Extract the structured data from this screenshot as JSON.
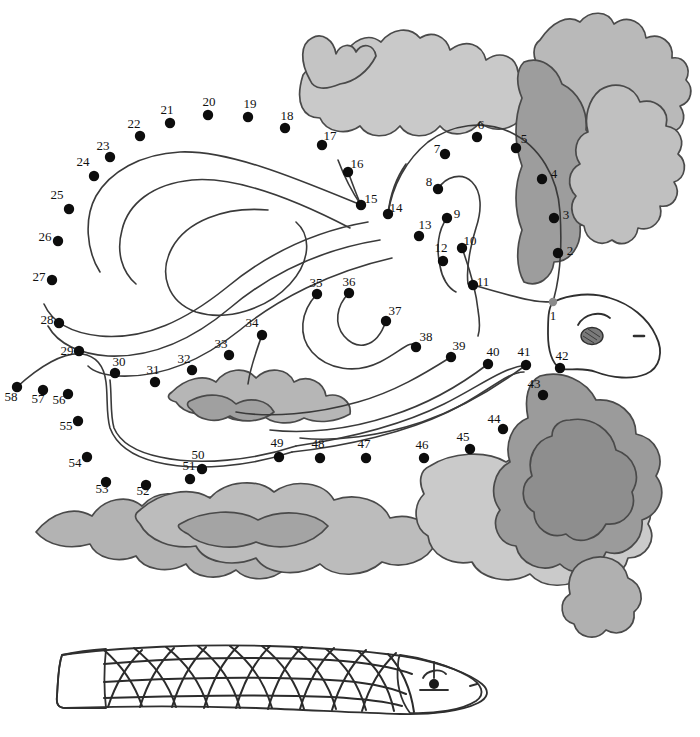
{
  "page": {
    "background_color": "#ffffff",
    "width": 700,
    "height": 737
  },
  "colors": {
    "dot": "#0d0d0d",
    "start_dot": "#8a8a8a",
    "label": "#111111",
    "guide_line": "#3a3a3a",
    "kelp_light": "#cfcfcf",
    "kelp_mid": "#b4b4b4",
    "kelp_dark": "#9a9a9a",
    "fish_body": "#d2d2d2",
    "fish_tail": "#c2c2c2",
    "outline": "#3c3c3c"
  },
  "puzzle": {
    "name": "sea-dragon-dot-to-dot",
    "dot_count": 58,
    "dots": [
      {
        "n": "1",
        "x": 553,
        "y": 302,
        "lx": 553,
        "ly": 320,
        "start": true
      },
      {
        "n": "2",
        "x": 558,
        "y": 253,
        "lx": 570,
        "ly": 255
      },
      {
        "n": "3",
        "x": 554,
        "y": 218,
        "lx": 566,
        "ly": 219
      },
      {
        "n": "4",
        "x": 542,
        "y": 179,
        "lx": 554,
        "ly": 178
      },
      {
        "n": "5",
        "x": 516,
        "y": 148,
        "lx": 524,
        "ly": 143
      },
      {
        "n": "6",
        "x": 477,
        "y": 137,
        "lx": 481,
        "ly": 129
      },
      {
        "n": "7",
        "x": 445,
        "y": 154,
        "lx": 437,
        "ly": 153
      },
      {
        "n": "8",
        "x": 438,
        "y": 189,
        "lx": 429,
        "ly": 186
      },
      {
        "n": "9",
        "x": 447,
        "y": 218,
        "lx": 457,
        "ly": 218
      },
      {
        "n": "10",
        "x": 462,
        "y": 248,
        "lx": 470,
        "ly": 245
      },
      {
        "n": "11",
        "x": 473,
        "y": 285,
        "lx": 483,
        "ly": 286
      },
      {
        "n": "12",
        "x": 443,
        "y": 261,
        "lx": 441,
        "ly": 252
      },
      {
        "n": "13",
        "x": 419,
        "y": 236,
        "lx": 425,
        "ly": 229
      },
      {
        "n": "14",
        "x": 388,
        "y": 214,
        "lx": 396,
        "ly": 212
      },
      {
        "n": "15",
        "x": 361,
        "y": 205,
        "lx": 371,
        "ly": 203
      },
      {
        "n": "16",
        "x": 348,
        "y": 172,
        "lx": 357,
        "ly": 168
      },
      {
        "n": "17",
        "x": 322,
        "y": 145,
        "lx": 330,
        "ly": 140
      },
      {
        "n": "18",
        "x": 285,
        "y": 128,
        "lx": 287,
        "ly": 120
      },
      {
        "n": "19",
        "x": 248,
        "y": 117,
        "lx": 250,
        "ly": 108
      },
      {
        "n": "20",
        "x": 208,
        "y": 115,
        "lx": 209,
        "ly": 106
      },
      {
        "n": "21",
        "x": 170,
        "y": 123,
        "lx": 167,
        "ly": 114
      },
      {
        "n": "22",
        "x": 140,
        "y": 136,
        "lx": 134,
        "ly": 128
      },
      {
        "n": "23",
        "x": 110,
        "y": 157,
        "lx": 103,
        "ly": 150
      },
      {
        "n": "24",
        "x": 94,
        "y": 176,
        "lx": 83,
        "ly": 166
      },
      {
        "n": "25",
        "x": 69,
        "y": 209,
        "lx": 57,
        "ly": 199
      },
      {
        "n": "26",
        "x": 58,
        "y": 241,
        "lx": 45,
        "ly": 241
      },
      {
        "n": "27",
        "x": 52,
        "y": 280,
        "lx": 39,
        "ly": 281
      },
      {
        "n": "28",
        "x": 59,
        "y": 323,
        "lx": 47,
        "ly": 324
      },
      {
        "n": "29",
        "x": 79,
        "y": 351,
        "lx": 67,
        "ly": 355
      },
      {
        "n": "30",
        "x": 115,
        "y": 373,
        "lx": 119,
        "ly": 366
      },
      {
        "n": "31",
        "x": 155,
        "y": 382,
        "lx": 153,
        "ly": 374
      },
      {
        "n": "32",
        "x": 192,
        "y": 370,
        "lx": 184,
        "ly": 363
      },
      {
        "n": "33",
        "x": 229,
        "y": 355,
        "lx": 221,
        "ly": 348
      },
      {
        "n": "34",
        "x": 262,
        "y": 335,
        "lx": 252,
        "ly": 327
      },
      {
        "n": "35",
        "x": 317,
        "y": 294,
        "lx": 316,
        "ly": 287
      },
      {
        "n": "36",
        "x": 349,
        "y": 293,
        "lx": 349,
        "ly": 286
      },
      {
        "n": "37",
        "x": 386,
        "y": 321,
        "lx": 395,
        "ly": 315
      },
      {
        "n": "38",
        "x": 416,
        "y": 347,
        "lx": 426,
        "ly": 341
      },
      {
        "n": "39",
        "x": 451,
        "y": 357,
        "lx": 459,
        "ly": 350
      },
      {
        "n": "40",
        "x": 488,
        "y": 364,
        "lx": 493,
        "ly": 356
      },
      {
        "n": "41",
        "x": 526,
        "y": 365,
        "lx": 524,
        "ly": 356
      },
      {
        "n": "42",
        "x": 560,
        "y": 368,
        "lx": 562,
        "ly": 360
      },
      {
        "n": "43",
        "x": 543,
        "y": 395,
        "lx": 534,
        "ly": 388
      },
      {
        "n": "44",
        "x": 503,
        "y": 429,
        "lx": 494,
        "ly": 423
      },
      {
        "n": "45",
        "x": 470,
        "y": 449,
        "lx": 463,
        "ly": 441
      },
      {
        "n": "46",
        "x": 424,
        "y": 458,
        "lx": 422,
        "ly": 449
      },
      {
        "n": "47",
        "x": 366,
        "y": 458,
        "lx": 364,
        "ly": 448
      },
      {
        "n": "48",
        "x": 320,
        "y": 458,
        "lx": 318,
        "ly": 448
      },
      {
        "n": "49",
        "x": 279,
        "y": 457,
        "lx": 277,
        "ly": 447
      },
      {
        "n": "50",
        "x": 202,
        "y": 469,
        "lx": 198,
        "ly": 459
      },
      {
        "n": "51",
        "x": 190,
        "y": 479,
        "lx": 189,
        "ly": 470
      },
      {
        "n": "52",
        "x": 146,
        "y": 485,
        "lx": 143,
        "ly": 495
      },
      {
        "n": "53",
        "x": 106,
        "y": 482,
        "lx": 102,
        "ly": 493
      },
      {
        "n": "54",
        "x": 87,
        "y": 457,
        "lx": 75,
        "ly": 467
      },
      {
        "n": "55",
        "x": 78,
        "y": 421,
        "lx": 66,
        "ly": 430
      },
      {
        "n": "56",
        "x": 68,
        "y": 394,
        "lx": 59,
        "ly": 404
      },
      {
        "n": "57",
        "x": 43,
        "y": 390,
        "lx": 38,
        "ly": 403
      },
      {
        "n": "58",
        "x": 17,
        "y": 387,
        "lx": 11,
        "ly": 401
      }
    ]
  },
  "reference_figure": {
    "name": "scaled-fish-body-reference",
    "description": "Shaded drawing of a scaled fish body with head and eye"
  }
}
